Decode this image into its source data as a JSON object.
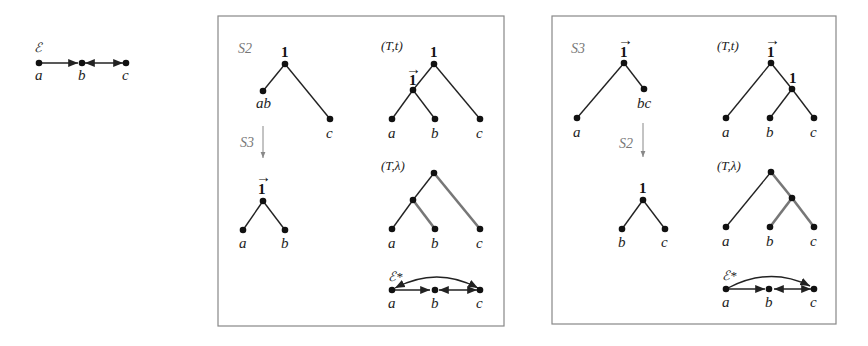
{
  "graph_E": {
    "title": "ℰ",
    "nodes": [
      "a",
      "b",
      "c"
    ],
    "arcs": [
      [
        "a",
        "b"
      ],
      [
        "b",
        "c"
      ],
      [
        "c",
        "b"
      ]
    ]
  },
  "panel_left": {
    "stage_first": "S2",
    "stage_second": "S3",
    "tree_first": {
      "root_label": "1",
      "leaves": [
        "ab",
        "c"
      ]
    },
    "tree_second": {
      "root_label": "1⃗",
      "root_arrow": "→",
      "root_digit": "1",
      "leaves": [
        "a",
        "b"
      ]
    },
    "Tt": {
      "title": "(T,t)",
      "root_label": "1",
      "inner_label": "1",
      "inner_arrow": "→",
      "leaves": [
        "a",
        "b",
        "c"
      ]
    },
    "Tlambda": {
      "title": "(T,λ)",
      "leaves": [
        "a",
        "b",
        "c"
      ],
      "colored_edges": [
        "root-c",
        "inner-b"
      ]
    },
    "E_star": {
      "title": "ℰ*",
      "nodes": [
        "a",
        "b",
        "c"
      ],
      "arcs": [
        [
          "a",
          "b"
        ],
        [
          "b",
          "c"
        ],
        [
          "c",
          "b"
        ],
        [
          "a",
          "c"
        ],
        [
          "c",
          "a"
        ]
      ]
    }
  },
  "panel_right": {
    "stage_first": "S3",
    "stage_second": "S2",
    "tree_first": {
      "root_label": "1",
      "root_arrow": "→",
      "leaves": [
        "a",
        "bc"
      ]
    },
    "tree_second": {
      "root_label": "1",
      "leaves": [
        "b",
        "c"
      ]
    },
    "Tt": {
      "title": "(T,t)",
      "root_label": "1",
      "root_arrow": "→",
      "inner_label": "1",
      "leaves": [
        "a",
        "b",
        "c"
      ]
    },
    "Tlambda": {
      "title": "(T,λ)",
      "leaves": [
        "a",
        "b",
        "c"
      ],
      "colored_edges": [
        "root-inner",
        "inner-b",
        "inner-c"
      ]
    },
    "E_star": {
      "title": "ℰ*",
      "nodes": [
        "a",
        "b",
        "c"
      ],
      "arcs": [
        [
          "a",
          "b"
        ],
        [
          "b",
          "c"
        ],
        [
          "c",
          "b"
        ],
        [
          "a",
          "c"
        ]
      ]
    }
  },
  "colors": {
    "ink": "#222222",
    "colored_edge": "#777777",
    "panel_border": "#888888",
    "stage_label": "#777777"
  }
}
